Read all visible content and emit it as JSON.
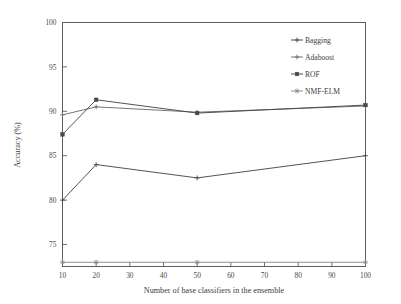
{
  "chart_data": {
    "type": "line",
    "title": "",
    "subtitle": "",
    "xlabel": "Number of base classifiers in the ensemble",
    "ylabel": "Accuracy (%)",
    "xlim": [
      10,
      100
    ],
    "ylim": [
      73,
      100
    ],
    "xticks": [
      10,
      20,
      30,
      40,
      50,
      60,
      70,
      80,
      90,
      100
    ],
    "xtick_labels": [
      "10",
      "20",
      "30",
      "40",
      "50",
      "60",
      "70",
      "80",
      "90",
      "100"
    ],
    "yticks": [
      75,
      80,
      85,
      90,
      95,
      100
    ],
    "ytick_labels": [
      "75",
      "80",
      "85",
      "90",
      "95",
      "100"
    ],
    "grid": false,
    "legend_position": "upper right",
    "x": [
      10,
      20,
      50,
      100
    ],
    "series": [
      {
        "name": "Bagging",
        "marker": "plus",
        "color": "#4a4a4a",
        "values": [
          80.0,
          84.0,
          82.5,
          85.0
        ]
      },
      {
        "name": "Adaboost",
        "marker": "plus",
        "color": "#6e6e6e",
        "values": [
          89.6,
          90.5,
          89.9,
          90.6
        ]
      },
      {
        "name": "ROF",
        "marker": "square",
        "color": "#4a4a4a",
        "values": [
          87.4,
          91.3,
          89.8,
          90.7
        ]
      },
      {
        "name": "NMF-ELM",
        "marker": "star",
        "color": "#8a8a8a",
        "values": [
          73.0,
          73.0,
          73.0,
          73.0
        ]
      }
    ]
  },
  "legend": {
    "entries": [
      {
        "label": "Bagging",
        "marker": "plus"
      },
      {
        "label": "Adaboost",
        "marker": "plus"
      },
      {
        "label": "ROF",
        "marker": "square"
      },
      {
        "label": "NMF-ELM",
        "marker": "star"
      }
    ]
  },
  "colors": {
    "axis": "#5d5d5d",
    "text": "#3c3c3c",
    "background": "#ffffff"
  }
}
